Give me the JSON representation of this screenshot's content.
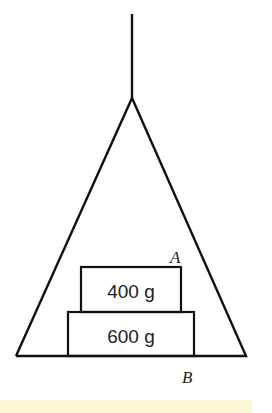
{
  "diagram": {
    "type": "physics-hanging-frame",
    "blocks": [
      {
        "label": "400 g",
        "position": "top"
      },
      {
        "label": "600 g",
        "position": "bottom"
      }
    ],
    "points": [
      {
        "label": "A",
        "location": "top-right corner of upper block"
      },
      {
        "label": "B",
        "location": "below base at right edge of lower block"
      }
    ],
    "colors": {
      "line": "#111111",
      "background": "#ffffff",
      "bottom_strip": "#fbf8d6"
    }
  }
}
